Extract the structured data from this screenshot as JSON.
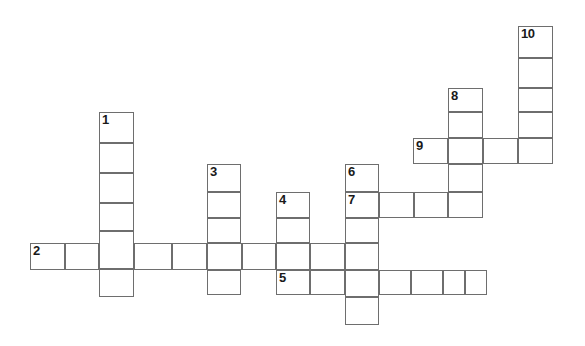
{
  "puzzle": {
    "kind": "crossword-grid",
    "title": "",
    "width_px": 585,
    "height_px": 346,
    "background_color": "#ffffff",
    "cell_border_color": "#6e6e6e",
    "number_color": "#1a1a1a",
    "cell_width_px": 34.5,
    "cell_height_px": 26.5,
    "columns_x": [
      30,
      64.5,
      99,
      133.5,
      172,
      207,
      241.5,
      276,
      310,
      345,
      379,
      413,
      448,
      483,
      518,
      552.5
    ],
    "rows_y": [
      26,
      58,
      88,
      112,
      138,
      164,
      192,
      218,
      243,
      270,
      297,
      325
    ],
    "clue_count": 10,
    "entries": [
      {
        "number": "1",
        "direction": "down",
        "start_col": 2,
        "start_row": 2,
        "length": 6,
        "x": 99,
        "y": 112,
        "cell_w": 34.5,
        "cell_h": 30.8
      },
      {
        "number": "2",
        "direction": "across",
        "start_col": 0,
        "start_row": 8,
        "length": 9,
        "x": 30,
        "y": 243,
        "cell_w": 35,
        "cell_h": 27
      },
      {
        "number": "3",
        "direction": "down",
        "start_col": 5,
        "start_row": 5,
        "length": 5,
        "x": 207,
        "y": 164,
        "cell_w": 34,
        "cell_h": 26.2
      },
      {
        "number": "4",
        "direction": "down",
        "start_col": 7,
        "start_row": 6,
        "length": 4,
        "x": 276,
        "y": 192,
        "cell_w": 34,
        "cell_h": 25.8
      },
      {
        "number": "5",
        "direction": "across",
        "start_col": 7,
        "start_row": 9,
        "length": 7,
        "x": 276,
        "y": 270,
        "cell_w": 30.3,
        "cell_h": 27
      },
      {
        "number": "6",
        "direction": "down",
        "start_col": 9,
        "start_row": 5,
        "length": 6,
        "x": 345,
        "y": 164,
        "cell_w": 34,
        "cell_h": 26.8
      },
      {
        "number": "7",
        "direction": "across",
        "start_col": 9,
        "start_row": 6,
        "length": 4,
        "x": 345,
        "y": 192,
        "cell_w": 35,
        "cell_h": 26
      },
      {
        "number": "8",
        "direction": "down",
        "start_col": 12,
        "start_row": 2,
        "length": 5,
        "x": 448,
        "y": 88,
        "cell_w": 35,
        "cell_h": 26
      },
      {
        "number": "9",
        "direction": "across",
        "start_col": 11,
        "start_row": 4,
        "length": 4,
        "x": 413,
        "y": 138,
        "cell_w": 35,
        "cell_h": 26
      },
      {
        "number": "10",
        "direction": "down",
        "start_col": 14,
        "start_row": 0,
        "length": 5,
        "x": 518,
        "y": 26,
        "cell_w": 35,
        "cell_h": 26
      }
    ],
    "cells": [
      {
        "name": "cell-r0c14",
        "x": 518,
        "y": 26,
        "w": 35,
        "h": 32,
        "number": "10"
      },
      {
        "name": "cell-r1c14",
        "x": 518,
        "y": 58,
        "w": 35,
        "h": 30,
        "number": ""
      },
      {
        "name": "cell-r2c14",
        "x": 518,
        "y": 88,
        "w": 35,
        "h": 24,
        "number": ""
      },
      {
        "name": "cell-r3c14",
        "x": 518,
        "y": 112,
        "w": 35,
        "h": 26,
        "number": ""
      },
      {
        "name": "cell-r4c14",
        "x": 518,
        "y": 138,
        "w": 35,
        "h": 26,
        "number": ""
      },
      {
        "name": "cell-r2c12",
        "x": 448,
        "y": 88,
        "w": 35,
        "h": 24,
        "number": "8"
      },
      {
        "name": "cell-r3c12",
        "x": 448,
        "y": 112,
        "w": 35,
        "h": 26,
        "number": ""
      },
      {
        "name": "cell-r4c12",
        "x": 448,
        "y": 138,
        "w": 35,
        "h": 26,
        "number": ""
      },
      {
        "name": "cell-r5c12",
        "x": 448,
        "y": 164,
        "w": 35,
        "h": 28,
        "number": ""
      },
      {
        "name": "cell-r6c12",
        "x": 448,
        "y": 192,
        "w": 35,
        "h": 26,
        "number": ""
      },
      {
        "name": "cell-r4c11",
        "x": 413,
        "y": 138,
        "w": 35,
        "h": 26,
        "number": "9"
      },
      {
        "name": "cell-r4c13",
        "x": 483,
        "y": 138,
        "w": 35,
        "h": 26,
        "number": ""
      },
      {
        "name": "cell-r5c9",
        "x": 345,
        "y": 164,
        "w": 34,
        "h": 28,
        "number": "6"
      },
      {
        "name": "cell-r6c9",
        "x": 345,
        "y": 192,
        "w": 34,
        "h": 26,
        "number": "7"
      },
      {
        "name": "cell-r7c9",
        "x": 345,
        "y": 218,
        "w": 34,
        "h": 25,
        "number": ""
      },
      {
        "name": "cell-r8c9",
        "x": 345,
        "y": 243,
        "w": 34,
        "h": 27,
        "number": ""
      },
      {
        "name": "cell-r9c9",
        "x": 345,
        "y": 270,
        "w": 34,
        "h": 27,
        "number": ""
      },
      {
        "name": "cell-r10c9",
        "x": 345,
        "y": 297,
        "w": 34,
        "h": 28,
        "number": ""
      },
      {
        "name": "cell-r6c10",
        "x": 379,
        "y": 192,
        "w": 35,
        "h": 26,
        "number": ""
      },
      {
        "name": "cell-r6c11",
        "x": 414,
        "y": 192,
        "w": 34,
        "h": 26,
        "number": ""
      },
      {
        "name": "cell-r2c2",
        "x": 99,
        "y": 112,
        "w": 34.5,
        "h": 31,
        "number": "1"
      },
      {
        "name": "cell-r3c2",
        "x": 99,
        "y": 143,
        "w": 34.5,
        "h": 30,
        "number": ""
      },
      {
        "name": "cell-r4c2",
        "x": 99,
        "y": 173,
        "w": 34.5,
        "h": 30,
        "number": ""
      },
      {
        "name": "cell-r5c2",
        "x": 99,
        "y": 203,
        "w": 34.5,
        "h": 28,
        "number": ""
      },
      {
        "name": "cell-r6c2",
        "x": 99,
        "y": 231,
        "w": 34.5,
        "h": 38,
        "number": ""
      },
      {
        "name": "cell-r7c2",
        "x": 99,
        "y": 269,
        "w": 34.5,
        "h": 28,
        "number": ""
      },
      {
        "name": "cell-r8c0",
        "x": 30,
        "y": 243,
        "w": 35,
        "h": 27,
        "number": "2"
      },
      {
        "name": "cell-r8c1",
        "x": 65,
        "y": 243,
        "w": 34,
        "h": 27,
        "number": ""
      },
      {
        "name": "cell-r8c3",
        "x": 133.5,
        "y": 243,
        "w": 38.5,
        "h": 27,
        "number": ""
      },
      {
        "name": "cell-r8c4",
        "x": 172,
        "y": 243,
        "w": 35,
        "h": 27,
        "number": ""
      },
      {
        "name": "cell-r8c5b",
        "x": 207,
        "y": 243,
        "w": 34.5,
        "h": 27,
        "number": ""
      },
      {
        "name": "cell-r8c6",
        "x": 241.5,
        "y": 243,
        "w": 34.5,
        "h": 27,
        "number": ""
      },
      {
        "name": "cell-r8c7",
        "x": 276,
        "y": 243,
        "w": 34,
        "h": 27,
        "number": ""
      },
      {
        "name": "cell-r8c8",
        "x": 310,
        "y": 243,
        "w": 35,
        "h": 27,
        "number": ""
      },
      {
        "name": "cell-r5c5",
        "x": 207,
        "y": 164,
        "w": 34,
        "h": 28,
        "number": "3"
      },
      {
        "name": "cell-r6c5",
        "x": 207,
        "y": 192,
        "w": 34,
        "h": 26,
        "number": ""
      },
      {
        "name": "cell-r7c5",
        "x": 207,
        "y": 218,
        "w": 34,
        "h": 25,
        "number": ""
      },
      {
        "name": "cell-r9c5",
        "x": 207,
        "y": 270,
        "w": 34,
        "h": 25,
        "number": ""
      },
      {
        "name": "cell-r6c7",
        "x": 276,
        "y": 192,
        "w": 34,
        "h": 26,
        "number": "4"
      },
      {
        "name": "cell-r7c7",
        "x": 276,
        "y": 218,
        "w": 34,
        "h": 25,
        "number": ""
      },
      {
        "name": "cell-r9c7",
        "x": 276,
        "y": 270,
        "w": 34,
        "h": 25,
        "number": "5"
      },
      {
        "name": "cell-r9c8",
        "x": 310,
        "y": 270,
        "w": 35,
        "h": 25,
        "number": ""
      },
      {
        "name": "cell-r9c10",
        "x": 379,
        "y": 270,
        "w": 32,
        "h": 25,
        "number": ""
      },
      {
        "name": "cell-r9c11",
        "x": 411,
        "y": 270,
        "w": 32,
        "h": 25,
        "number": ""
      },
      {
        "name": "cell-r9c12",
        "x": 443,
        "y": 270,
        "w": 22,
        "h": 25,
        "number": ""
      },
      {
        "name": "cell-r9c13",
        "x": 465,
        "y": 270,
        "w": 22,
        "h": 25,
        "number": ""
      }
    ]
  }
}
